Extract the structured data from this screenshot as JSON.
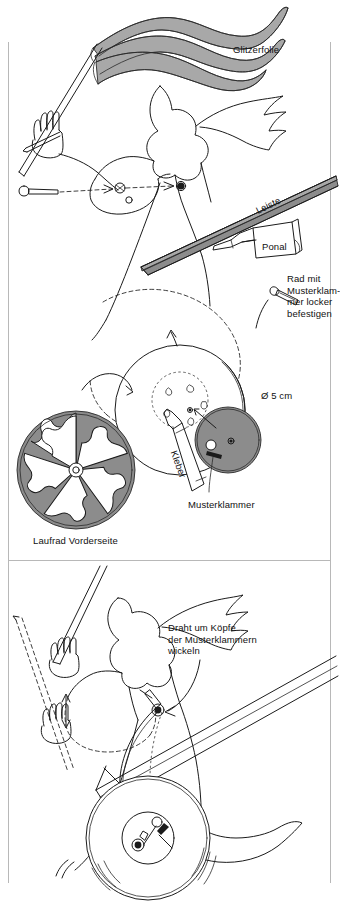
{
  "document": {
    "language": "de",
    "type": "craft-instruction-illustration",
    "title": "Bastelanleitung Windrad-Figur"
  },
  "panels": [
    {
      "id": "panel-top",
      "name": "assembly-step-1",
      "labels": [
        {
          "id": "glitzerfolie",
          "text": "Glitzerfolie",
          "x": 233,
          "y": 44
        },
        {
          "id": "leiste",
          "text": "Leiste",
          "x": 254,
          "y": 206,
          "rotation": -13
        },
        {
          "id": "ponal",
          "text": "Ponal",
          "x": 262,
          "y": 241
        },
        {
          "id": "rad-mit-musterklammer",
          "text": "Rad mit\nMusterklam-\nmer locker\nbefestigen",
          "x": 287,
          "y": 273
        }
      ]
    },
    {
      "id": "panel-middle",
      "name": "wheel-detail",
      "labels": [
        {
          "id": "durchmesser",
          "text": "Ø 5 cm",
          "x": 261,
          "y": 390
        },
        {
          "id": "kleber",
          "text": "Kleber",
          "x": 179,
          "y": 449,
          "rotation": 70
        },
        {
          "id": "musterklammer",
          "text": "Musterklammer",
          "x": 188,
          "y": 499
        },
        {
          "id": "laufrad-vorderseite",
          "text": "Laufrad Vorderseite",
          "x": 33,
          "y": 535
        }
      ]
    },
    {
      "id": "panel-bottom",
      "name": "assembly-step-2",
      "labels": [
        {
          "id": "draht-um-koepfe",
          "text": "Draht um Köpfe\nder Musterklammern\nwickeln",
          "x": 168,
          "y": 622
        }
      ]
    }
  ],
  "colors": {
    "ink": "#1b1b1b",
    "gray_fill": "#8c8c8c",
    "gray_light": "#a8a8a8",
    "frame": "#b8b8b8",
    "background": "#ffffff"
  },
  "frame": {
    "left_x": 8,
    "right_x": 330,
    "top_y": 42,
    "divider_y": 560,
    "bottom_y": 883
  }
}
